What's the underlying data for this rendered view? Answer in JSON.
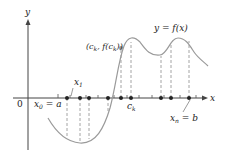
{
  "diagram": {
    "axes": {
      "x_label": "x",
      "y_label": "y",
      "origin_label": "0"
    },
    "curve_label": "y = f(x)",
    "point_label": "(c_k, f(c_k))",
    "labels": {
      "x0_eq_a": {
        "main": "x",
        "sub": "0",
        "rest": " = a"
      },
      "x1": {
        "main": "x",
        "sub": "1"
      },
      "ck": {
        "main": "c",
        "sub": "k"
      },
      "xn_eq_b": {
        "main": "x",
        "sub": "n",
        "rest": " = b"
      },
      "point": {
        "pre": "(c",
        "sub1": "k",
        "mid": ", f(c",
        "sub2": "k",
        "post": "))"
      },
      "curve": {
        "text": "y = f(x)"
      }
    },
    "colors": {
      "axis": "#444444",
      "curve": "#9a9a9a",
      "dashed": "#9a9a9a",
      "points": "#222222",
      "text": "#222222"
    },
    "sample_points_x": [
      61,
      80,
      89,
      108,
      121,
      131,
      160,
      170,
      190
    ],
    "tick_marks_x": [
      58,
      70,
      84,
      96,
      102,
      114,
      126,
      140,
      150,
      165,
      180,
      198
    ]
  }
}
